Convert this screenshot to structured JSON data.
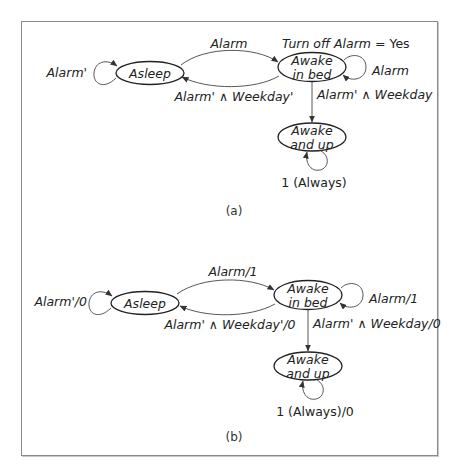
{
  "diagrams": [
    {
      "caption": "(a)",
      "states": {
        "asleep": {
          "label": "Asleep"
        },
        "awake_in_bed": {
          "line1": "Awake",
          "line2": "in bed",
          "output_note_italic": "Turn off Alarm",
          "output_note_plain": " = Yes"
        },
        "awake_and_up": {
          "line1": "Awake",
          "line2": "and up"
        }
      },
      "transitions": {
        "asleep_self": "Alarm'",
        "asleep_to_awake_in_bed": "Alarm",
        "awake_in_bed_to_asleep": "Alarm' ∧ Weekday'",
        "awake_in_bed_self": "Alarm",
        "awake_in_bed_to_awake_and_up": "Alarm' ∧ Weekday",
        "awake_and_up_self": "1 (Always)"
      }
    },
    {
      "caption": "(b)",
      "states": {
        "asleep": {
          "label": "Asleep"
        },
        "awake_in_bed": {
          "line1": "Awake",
          "line2": "in bed"
        },
        "awake_and_up": {
          "line1": "Awake",
          "line2": "and up"
        }
      },
      "transitions": {
        "asleep_self": "Alarm'/0",
        "asleep_to_awake_in_bed": "Alarm/1",
        "awake_in_bed_to_asleep": "Alarm' ∧ Weekday'/0",
        "awake_in_bed_self": "Alarm/1",
        "awake_in_bed_to_awake_and_up": "Alarm' ∧ Weekday/0",
        "awake_and_up_self": "1 (Always)/0"
      }
    }
  ]
}
